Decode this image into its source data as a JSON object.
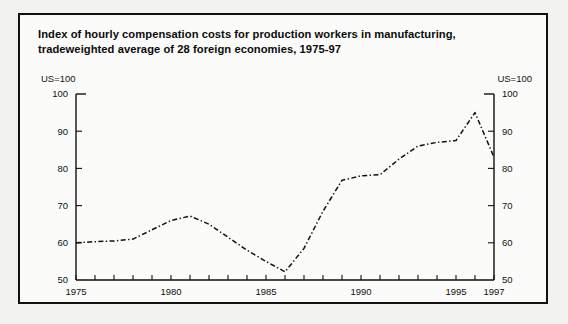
{
  "figure": {
    "title": "Index of hourly compensation costs for production workers in manufacturing, tradeweighted average of 28 foreign economies, 1975-97",
    "unit_label_left": "US=100",
    "unit_label_right": "US=100",
    "border_color": "#111111",
    "line_color": "#101010",
    "background": "#fbfbfa"
  },
  "chart_data": {
    "type": "line",
    "title": "Index of hourly compensation costs for production workers in manufacturing, tradeweighted average of 28 foreign economies, 1975-97",
    "xlabel": "",
    "ylabel": "US=100",
    "ylim": [
      50,
      100
    ],
    "xlim": [
      1975,
      1997
    ],
    "grid": false,
    "legend": "none",
    "line_style": "dash-dot",
    "y_ticks": [
      50,
      60,
      70,
      80,
      90,
      100
    ],
    "y_tick_labels": [
      "50",
      "60",
      "70",
      "80",
      "90",
      "100"
    ],
    "y_axis_duplicated_right": true,
    "x_ticks": [
      1975,
      1976,
      1977,
      1978,
      1979,
      1980,
      1981,
      1982,
      1983,
      1984,
      1985,
      1986,
      1987,
      1988,
      1989,
      1990,
      1991,
      1992,
      1993,
      1994,
      1995,
      1996,
      1997
    ],
    "x_tick_labels_shown": [
      "1975",
      "1980",
      "1985",
      "1990",
      "1995",
      "1997"
    ],
    "x_labeled_years": [
      1975,
      1980,
      1985,
      1990,
      1995,
      1997
    ],
    "series": [
      {
        "name": "Index of hourly compensation costs (US=100)",
        "x": [
          1975,
          1976,
          1977,
          1978,
          1979,
          1980,
          1981,
          1982,
          1983,
          1984,
          1985,
          1986,
          1987,
          1988,
          1989,
          1990,
          1991,
          1992,
          1993,
          1994,
          1995,
          1996,
          1997
        ],
        "values": [
          60.0,
          60.3,
          60.5,
          61.0,
          63.5,
          66.0,
          67.2,
          65.0,
          61.5,
          58.0,
          55.0,
          52.2,
          58.5,
          68.5,
          76.8,
          78.0,
          78.3,
          82.5,
          86.0,
          87.0,
          87.5,
          95.0,
          83.0
        ]
      }
    ]
  }
}
